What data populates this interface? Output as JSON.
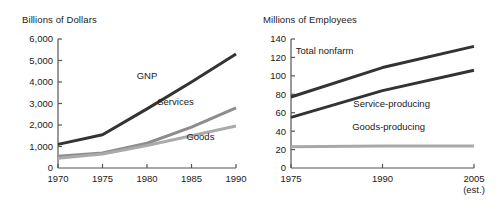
{
  "chart_data": [
    {
      "type": "line",
      "title": "Billions of Dollars",
      "xlabel": "",
      "ylabel": "Billions of Dollars",
      "x": [
        1970,
        1975,
        1980,
        1985,
        1990
      ],
      "xtick_labels": [
        "1970",
        "1975",
        "1980",
        "1985",
        "1990"
      ],
      "xlim": [
        1970,
        1990
      ],
      "ylim": [
        0,
        6000
      ],
      "ytick_labels": [
        "0",
        "1,000",
        "2,000",
        "3,000",
        "4,000",
        "5,000",
        "6,000"
      ],
      "ytick_values": [
        0,
        1000,
        2000,
        3000,
        4000,
        5000,
        6000
      ],
      "grid": false,
      "legend": "inline-labels",
      "series": [
        {
          "name": "GNP",
          "color": "#333333",
          "values": [
            1100,
            1550,
            2750,
            4000,
            5300
          ]
        },
        {
          "name": "Services",
          "color": "#8c8c8c",
          "values": [
            550,
            700,
            1150,
            1900,
            2800
          ]
        },
        {
          "name": "Goods",
          "color": "#aaaaaa",
          "values": [
            450,
            650,
            1050,
            1500,
            1950
          ]
        }
      ],
      "annotations": [
        {
          "text": "GNP",
          "x": 1980.0,
          "y": 4150
        },
        {
          "text": "Services",
          "x": 1983.2,
          "y": 2950
        },
        {
          "text": "Goods",
          "x": 1986.0,
          "y": 1300
        }
      ]
    },
    {
      "type": "line",
      "title": "Millions of Employees",
      "xlabel": "",
      "ylabel": "Millions of Employees",
      "x": [
        1975,
        1990,
        2005
      ],
      "xtick_labels": [
        "1975",
        "1990",
        "2005"
      ],
      "xtick_sublabel": "(est.)",
      "xlim": [
        1975,
        2005
      ],
      "ylim": [
        0,
        140
      ],
      "ytick_labels": [
        "0",
        "20",
        "40",
        "60",
        "80",
        "100",
        "120",
        "140"
      ],
      "ytick_values": [
        0,
        20,
        40,
        60,
        80,
        100,
        120,
        140
      ],
      "grid": false,
      "legend": "inline-labels",
      "series": [
        {
          "name": "Total nonfarm",
          "color": "#333333",
          "values": [
            77,
            109,
            132
          ]
        },
        {
          "name": "Service-producing",
          "color": "#333333",
          "values": [
            55,
            84,
            106
          ]
        },
        {
          "name": "Goods-producing",
          "color": "#a8a8a8",
          "values": [
            23,
            24,
            24
          ]
        }
      ],
      "annotations": [
        {
          "text": "Total nonfarm",
          "x": 1980.5,
          "y": 124
        },
        {
          "text": "Service-producing",
          "x": 1991.5,
          "y": 66
        },
        {
          "text": "Goods-producing",
          "x": 1991.0,
          "y": 41
        }
      ]
    }
  ]
}
